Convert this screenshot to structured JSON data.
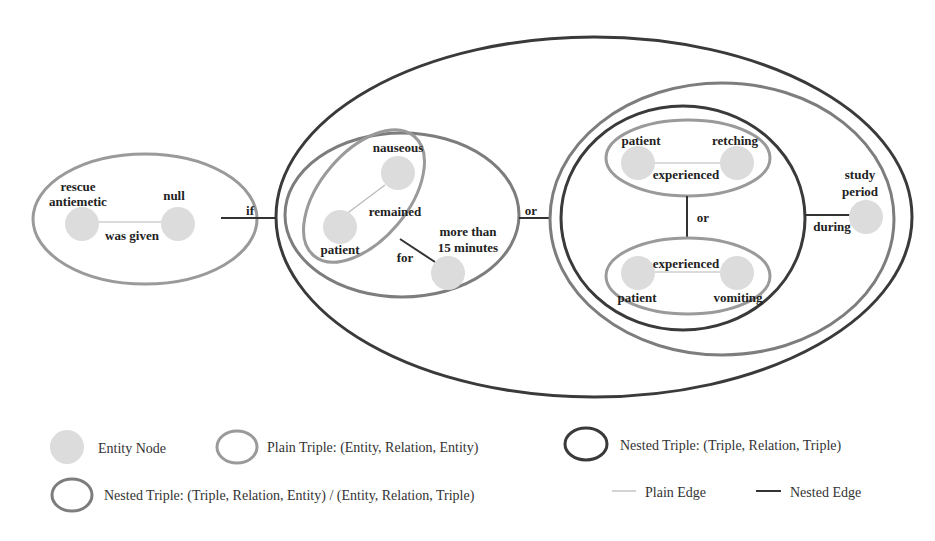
{
  "colors": {
    "entity_fill": "#dcdcdc",
    "plain_triple_stroke": "#9a9a9a",
    "nested_triple_entity_stroke": "#7d7d7d",
    "nested_triple_triple_stroke": "#3a3a3a",
    "plain_edge": "#b8b8b8",
    "nested_edge": "#333333"
  },
  "diagram": {
    "triple1": {
      "head": [
        "rescue",
        "antiemetic"
      ],
      "relation": "was given",
      "tail": "null"
    },
    "connector_if": "if",
    "triple2": {
      "head": "patient",
      "relation": "remained",
      "tail": "nauseous"
    },
    "nested_for": {
      "relation": "for",
      "tail": [
        "more than",
        "15 minutes"
      ]
    },
    "connector_or_outer": "or",
    "triple3": {
      "head": "patient",
      "relation": "experienced",
      "tail": "retching"
    },
    "connector_or_inner": "or",
    "triple4": {
      "head": "patient",
      "relation": "experienced",
      "tail": "vomiting"
    },
    "nested_during": {
      "relation": "during",
      "tail": [
        "study",
        "period"
      ]
    }
  },
  "legend": {
    "entity_node": "Entity Node",
    "plain_triple": "Plain Triple: (Entity, Relation, Entity)",
    "nested_triple_tt": "Nested Triple: (Triple, Relation, Triple)",
    "nested_triple_te": "Nested Triple:  (Triple, Relation, Entity) / (Entity, Relation, Triple)",
    "plain_edge": "Plain Edge",
    "nested_edge": "Nested Edge"
  }
}
